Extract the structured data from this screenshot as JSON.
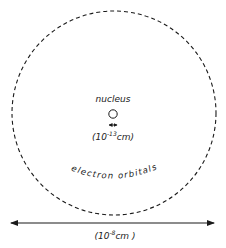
{
  "diagram": {
    "type": "atom-scale-diagram",
    "colors": {
      "ink": "#1a1a1a",
      "background": "#ffffff"
    },
    "nucleus": {
      "label": "nucleus",
      "size_label": "(10",
      "size_exponent": "-13",
      "size_unit": "cm)"
    },
    "orbitals": {
      "label": "electron orbitals"
    },
    "atom_size": {
      "label": "(10",
      "exponent": "-8",
      "unit": "cm )"
    }
  }
}
